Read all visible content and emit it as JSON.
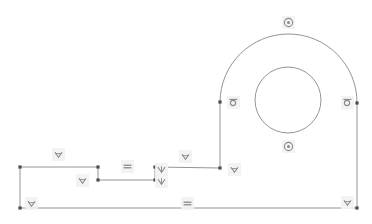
{
  "canvas": {
    "width": 372,
    "height": 224,
    "background": "#ffffff",
    "line_color": "#888888",
    "point_color": "#4d4d4d",
    "badge_background": "#f2f2f2",
    "badge_glyph_color": "#808080"
  },
  "sketch": {
    "name": "cad-sketch-profile",
    "description": "Stepped bracket profile with arched top and concentric bore",
    "vertices": [
      {
        "name": "v-top-left",
        "x": 20,
        "y": 167
      },
      {
        "name": "v-step1-top",
        "x": 98,
        "y": 167
      },
      {
        "name": "v-step1-bottom",
        "x": 98,
        "y": 180
      },
      {
        "name": "v-step2-bottom",
        "x": 155,
        "y": 180
      },
      {
        "name": "v-step2-top",
        "x": 155,
        "y": 167
      },
      {
        "name": "v-arc-base-left",
        "x": 220,
        "y": 168
      },
      {
        "name": "v-arc-start-left",
        "x": 220,
        "y": 102
      },
      {
        "name": "v-arc-end-right",
        "x": 357,
        "y": 103
      },
      {
        "name": "v-bottom-right",
        "x": 357,
        "y": 208
      },
      {
        "name": "v-bottom-left",
        "x": 20,
        "y": 208
      }
    ],
    "segments": [
      {
        "name": "seg-top-left-horizontal",
        "type": "line",
        "x1": 20,
        "y1": 167,
        "x2": 98,
        "y2": 167
      },
      {
        "name": "seg-step1-vertical",
        "type": "line",
        "x1": 98,
        "y1": 167,
        "x2": 98,
        "y2": 180
      },
      {
        "name": "seg-step-horizontal",
        "type": "line",
        "x1": 98,
        "y1": 180,
        "x2": 155,
        "y2": 180
      },
      {
        "name": "seg-step2-vertical",
        "type": "line",
        "x1": 155,
        "y1": 180,
        "x2": 155,
        "y2": 167
      },
      {
        "name": "seg-upper-horizontal",
        "type": "line",
        "x1": 155,
        "y1": 167,
        "x2": 220,
        "y2": 168
      },
      {
        "name": "seg-left-riser-vertical",
        "type": "line",
        "x1": 220,
        "y1": 168,
        "x2": 220,
        "y2": 102
      },
      {
        "name": "seg-right-vertical",
        "type": "line",
        "x1": 357,
        "y1": 103,
        "x2": 357,
        "y2": 208
      },
      {
        "name": "seg-bottom-horizontal",
        "type": "line",
        "x1": 357,
        "y1": 208,
        "x2": 20,
        "y2": 208
      },
      {
        "name": "seg-left-vertical",
        "type": "line",
        "x1": 20,
        "y1": 208,
        "x2": 20,
        "y2": 167
      }
    ],
    "arc": {
      "name": "arc-outer-top",
      "type": "arc",
      "path": "M 220 102 A 68.5 68.5 0 0 1 357 103",
      "center_x": 288.5,
      "center_y": 102.5,
      "radius": 68.5
    },
    "circle": {
      "name": "circle-inner-bore",
      "type": "circle",
      "center_x": 288,
      "center_y": 100,
      "radius": 33
    }
  },
  "constraints": [
    {
      "name": "constraint-horizontal-top-left",
      "glyph": "horizontal-icon",
      "x": 52,
      "y": 148,
      "label": "Horizontal"
    },
    {
      "name": "constraint-horizontal-step-upper",
      "glyph": "horizontal-icon",
      "x": 76,
      "y": 174,
      "label": "Horizontal"
    },
    {
      "name": "constraint-horizontal-left-bottom",
      "glyph": "horizontal-icon",
      "x": 25,
      "y": 197,
      "label": "Horizontal"
    },
    {
      "name": "constraint-equal-step-horizontal",
      "glyph": "equal-icon",
      "x": 121,
      "y": 160,
      "label": "Equal"
    },
    {
      "name": "constraint-vertical-step2-upper",
      "glyph": "vertical-icon",
      "x": 155,
      "y": 163,
      "label": "Vertical"
    },
    {
      "name": "constraint-vertical-step2-lower",
      "glyph": "vertical-icon",
      "x": 155,
      "y": 175,
      "label": "Vertical"
    },
    {
      "name": "constraint-horizontal-upper-mid",
      "glyph": "horizontal-icon",
      "x": 179,
      "y": 150,
      "label": "Horizontal"
    },
    {
      "name": "constraint-horizontal-arc-base",
      "glyph": "horizontal-icon",
      "x": 228,
      "y": 163,
      "label": "Horizontal"
    },
    {
      "name": "constraint-tangent-left",
      "glyph": "tangent-icon",
      "x": 227,
      "y": 96,
      "label": "Tangent"
    },
    {
      "name": "constraint-tangent-right",
      "glyph": "tangent-icon",
      "x": 341,
      "y": 96,
      "label": "Tangent"
    },
    {
      "name": "constraint-concentric-top",
      "glyph": "concentric-icon",
      "x": 282,
      "y": 16,
      "label": "Concentric"
    },
    {
      "name": "constraint-concentric-bottom",
      "glyph": "concentric-icon",
      "x": 282,
      "y": 140,
      "label": "Concentric"
    },
    {
      "name": "constraint-equal-bottom",
      "glyph": "equal-icon",
      "x": 181,
      "y": 197,
      "label": "Equal"
    },
    {
      "name": "constraint-horizontal-bottom-right",
      "glyph": "horizontal-icon",
      "x": 341,
      "y": 196,
      "label": "Horizontal"
    }
  ]
}
